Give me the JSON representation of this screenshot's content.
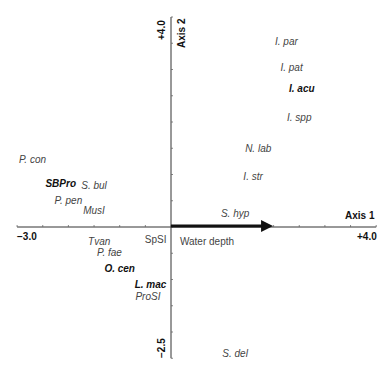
{
  "chart_data": {
    "type": "scatter",
    "title": "",
    "xlabel": "Axis 1",
    "ylabel": "Axis 2",
    "xlim": [
      -3.0,
      4.0
    ],
    "ylim": [
      -2.5,
      4.0
    ],
    "x_tick_labels": [
      "−3.0",
      "+4.0"
    ],
    "y_tick_labels": [
      "+4.0",
      "−2.5"
    ],
    "grid": false,
    "legend": null,
    "tick_interval": 0.5,
    "points": [
      {
        "label": "I. par",
        "x": 2.25,
        "y": 3.55,
        "bold": false,
        "italic": true
      },
      {
        "label": "I. pat",
        "x": 2.35,
        "y": 3.05,
        "bold": false,
        "italic": true
      },
      {
        "label": "I. acu",
        "x": 2.55,
        "y": 2.65,
        "bold": true,
        "italic": true
      },
      {
        "label": "I. spp",
        "x": 2.5,
        "y": 2.1,
        "bold": false,
        "italic": true
      },
      {
        "label": "N. lab",
        "x": 1.7,
        "y": 1.5,
        "bold": false,
        "italic": true
      },
      {
        "label": "I. str",
        "x": 1.6,
        "y": 0.97,
        "bold": false,
        "italic": true
      },
      {
        "label": "S. hyp",
        "x": 1.25,
        "y": 0.27,
        "bold": false,
        "italic": true
      },
      {
        "label": "S. del",
        "x": 1.25,
        "y": -2.4,
        "bold": false,
        "italic": true
      },
      {
        "label": "P. con",
        "x": -2.7,
        "y": 1.3,
        "bold": false,
        "italic": true
      },
      {
        "label": "SBPro",
        "x": -2.15,
        "y": 0.84,
        "bold": true,
        "italic": true
      },
      {
        "label": "S. bul",
        "x": -1.5,
        "y": 0.8,
        "bold": false,
        "italic": true
      },
      {
        "label": "P. pen",
        "x": -2.0,
        "y": 0.52,
        "bold": false,
        "italic": true
      },
      {
        "label": "MusI",
        "x": -1.5,
        "y": 0.32,
        "bold": false,
        "italic": true
      },
      {
        "label": "Tvan",
        "x": -1.4,
        "y": -0.27,
        "bold": false,
        "italic": true
      },
      {
        "label": "SpSI",
        "x": -0.3,
        "y": -0.22,
        "bold": false,
        "italic": false
      },
      {
        "label": "P. fae",
        "x": -1.2,
        "y": -0.48,
        "bold": false,
        "italic": true
      },
      {
        "label": "O. cen",
        "x": -1.0,
        "y": -0.78,
        "bold": true,
        "italic": true
      },
      {
        "label": "L. mac",
        "x": -0.4,
        "y": -1.08,
        "bold": true,
        "italic": true
      },
      {
        "label": "ProSI",
        "x": -0.45,
        "y": -1.32,
        "bold": false,
        "italic": true
      }
    ],
    "vectors": [
      {
        "label": "Water depth",
        "x": 1.95,
        "y": 0.0
      }
    ]
  },
  "axes": {
    "x_title": "Axis 1",
    "y_title": "Axis 2",
    "x_min_label": "−3.0",
    "x_max_label": "+4.0",
    "y_max_label": "+4.0",
    "y_min_label": "−2.5"
  },
  "vector_label": "Water depth"
}
